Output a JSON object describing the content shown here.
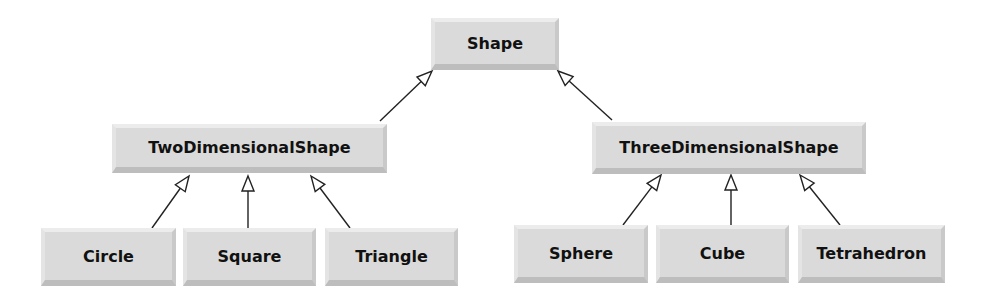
{
  "diagram": {
    "type": "class-inheritance-hierarchy",
    "colors": {
      "box_fill": "#dadada",
      "text": "#111111",
      "edge": "#222222",
      "background": "#ffffff"
    },
    "nodes": [
      {
        "id": "shape",
        "label": "Shape",
        "x": 431,
        "y": 18,
        "w": 128,
        "h": 52
      },
      {
        "id": "two_dimensional_shape",
        "label": "TwoDimensionalShape",
        "x": 112,
        "y": 124,
        "w": 275,
        "h": 49
      },
      {
        "id": "three_dimensional_shape",
        "label": "ThreeDimensionalShape",
        "x": 592,
        "y": 122,
        "w": 274,
        "h": 52
      },
      {
        "id": "circle",
        "label": "Circle",
        "x": 41,
        "y": 228,
        "w": 135,
        "h": 58
      },
      {
        "id": "square",
        "label": "Square",
        "x": 183,
        "y": 228,
        "w": 133,
        "h": 58
      },
      {
        "id": "triangle",
        "label": "Triangle",
        "x": 325,
        "y": 228,
        "w": 133,
        "h": 58
      },
      {
        "id": "sphere",
        "label": "Sphere",
        "x": 514,
        "y": 225,
        "w": 134,
        "h": 58
      },
      {
        "id": "cube",
        "label": "Cube",
        "x": 656,
        "y": 225,
        "w": 133,
        "h": 58
      },
      {
        "id": "tetrahedron",
        "label": "Tetrahedron",
        "x": 798,
        "y": 225,
        "w": 147,
        "h": 58
      }
    ],
    "edges": [
      {
        "from": "two_dimensional_shape",
        "to": "shape",
        "arrow": "hollow-triangle",
        "x1": 380,
        "y1": 121,
        "x2": 432,
        "y2": 71
      },
      {
        "from": "three_dimensional_shape",
        "to": "shape",
        "arrow": "hollow-triangle",
        "x1": 612,
        "y1": 120,
        "x2": 558,
        "y2": 71
      },
      {
        "from": "circle",
        "to": "two_dimensional_shape",
        "arrow": "hollow-triangle",
        "x1": 152,
        "y1": 228,
        "x2": 189,
        "y2": 176
      },
      {
        "from": "square",
        "to": "two_dimensional_shape",
        "arrow": "hollow-triangle",
        "x1": 248,
        "y1": 228,
        "x2": 248,
        "y2": 176
      },
      {
        "from": "triangle",
        "to": "two_dimensional_shape",
        "arrow": "hollow-triangle",
        "x1": 350,
        "y1": 228,
        "x2": 311,
        "y2": 176
      },
      {
        "from": "sphere",
        "to": "three_dimensional_shape",
        "arrow": "hollow-triangle",
        "x1": 623,
        "y1": 225,
        "x2": 661,
        "y2": 175
      },
      {
        "from": "cube",
        "to": "three_dimensional_shape",
        "arrow": "hollow-triangle",
        "x1": 731,
        "y1": 225,
        "x2": 731,
        "y2": 175
      },
      {
        "from": "tetrahedron",
        "to": "three_dimensional_shape",
        "arrow": "hollow-triangle",
        "x1": 840,
        "y1": 225,
        "x2": 800,
        "y2": 175
      }
    ]
  }
}
